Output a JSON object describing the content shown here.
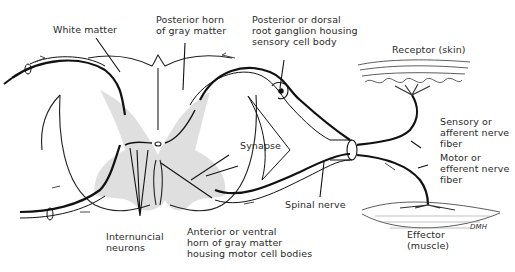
{
  "diagram": {
    "type": "reflex arc / spinal cord cross-section",
    "labels": {
      "white_matter": "White matter",
      "posterior_horn": "Posterior horn\nof gray matter",
      "dorsal_root_ganglion": "Posterior or dorsal\nroot ganglion housing\nsensory cell body",
      "receptor": "Receptor (skin)",
      "sensory_fiber": "Sensory or\nafferent nerve\nfiber",
      "motor_fiber": "Motor or\nefferent nerve\nfiber",
      "synapse": "Synapse",
      "spinal_nerve": "Spinal nerve",
      "effector": "Effector\n(muscle)",
      "anterior_horn": "Anterior or ventral\nhorn of gray matter\nhousing motor cell bodies",
      "internuncial": "Internuncial\nneurons",
      "signature": "DMH"
    },
    "colors": {
      "line": "#111111",
      "gray_matter": "#d6d6d6",
      "text": "#2a2a2a"
    }
  }
}
